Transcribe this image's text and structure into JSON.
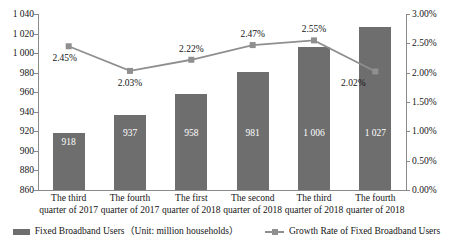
{
  "chart_data": {
    "type": "bar",
    "title": "",
    "subtitle": "",
    "xlabel": "",
    "ylabel": "",
    "grid": false,
    "legend_position": "bottom",
    "categories": [
      "The third\nquarter of 2017",
      "The fourth\nquarter of 2017",
      "The first\nquarter of 2018",
      "The second\nquarter of 2018",
      "The third\nquarter of 2018",
      "The fourth\nquarter of 2018"
    ],
    "series": [
      {
        "name": "Fixed Broadband Users（Unit: million households）",
        "type": "bar",
        "axis": "left",
        "values": [
          918,
          937,
          958,
          981,
          1006,
          1027
        ],
        "labels": [
          "918",
          "937",
          "958",
          "981",
          "1 006",
          "1 027"
        ],
        "color": "#6e6e6e"
      },
      {
        "name": "Growth Rate of Fixed Broadband Users",
        "type": "line",
        "axis": "right",
        "values": [
          2.45,
          2.03,
          2.22,
          2.47,
          2.55,
          2.02
        ],
        "labels": [
          "2.45%",
          "2.03%",
          "2.22%",
          "2.47%",
          "2.55%",
          "2.02%"
        ],
        "color": "#8f8f8f"
      }
    ],
    "left_axis": {
      "min": 860,
      "max": 1040,
      "step": 20,
      "ticks": [
        "860",
        "880",
        "900",
        "920",
        "940",
        "960",
        "980",
        "1 000",
        "1 020",
        "1 040"
      ]
    },
    "right_axis": {
      "min": 0.0,
      "max": 3.0,
      "step": 0.5,
      "ticks": [
        "0.00%",
        "0.50%",
        "1.00%",
        "1.50%",
        "2.00%",
        "2.50%",
        "3.00%"
      ]
    }
  },
  "legend": {
    "bar_label": "Fixed Broadband Users（Unit: million households）",
    "line_label": "Growth Rate of Fixed Broadband Users"
  }
}
